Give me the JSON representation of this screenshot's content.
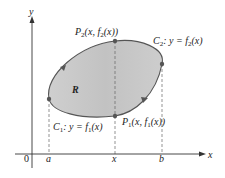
{
  "figure": {
    "axes": {
      "x_label": "x",
      "y_label": "y",
      "origin_label": "0"
    },
    "ticks": {
      "a": "a",
      "x": "x",
      "b": "b"
    },
    "region_label": "R",
    "curves": {
      "c1": {
        "name": "C",
        "sub": "1",
        "eq_prefix": ":  y = f",
        "eq_sub": "1",
        "eq_suffix": "(x)"
      },
      "c2": {
        "name": "C",
        "sub": "2",
        "eq_prefix": ":  y = f",
        "eq_sub": "2",
        "eq_suffix": "(x)"
      }
    },
    "points": {
      "p1": {
        "name": "P",
        "sub": "1",
        "mid": "(x, f",
        "fsub": "1",
        "end": "(x))"
      },
      "p2": {
        "name": "P",
        "sub": "2",
        "mid": "(x, f",
        "fsub": "2",
        "end": "(x))"
      }
    },
    "colors": {
      "region_fill": "#c9c9c9",
      "curve": "#555555",
      "axis": "#333333",
      "dash": "#666666"
    }
  }
}
